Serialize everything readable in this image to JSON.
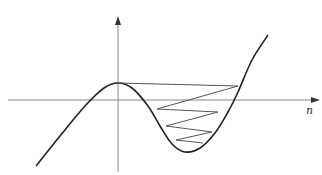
{
  "diagram": {
    "type": "cobweb-plot",
    "x_axis_label": "n",
    "colors": {
      "curve": "#222222",
      "axis": "#888888",
      "cobweb": "#555555"
    },
    "axes": {
      "origin": [
        118,
        100
      ],
      "x_axis_end": 316,
      "y_axis_top": 20,
      "y_axis_bottom": 172
    },
    "curve_points": [
      [
        36,
        166
      ],
      [
        60,
        136
      ],
      [
        85,
        106
      ],
      [
        104,
        88
      ],
      [
        118,
        83
      ],
      [
        132,
        88
      ],
      [
        148,
        106
      ],
      [
        160,
        126
      ],
      [
        172,
        144
      ],
      [
        185,
        152
      ],
      [
        200,
        148
      ],
      [
        215,
        133
      ],
      [
        228,
        112
      ],
      [
        238,
        92
      ],
      [
        252,
        60
      ],
      [
        268,
        35
      ]
    ],
    "cobweb_points": [
      [
        118,
        83
      ],
      [
        238,
        86
      ],
      [
        157,
        109
      ],
      [
        218,
        112
      ],
      [
        166,
        126
      ],
      [
        212,
        132
      ],
      [
        176,
        140
      ],
      [
        203,
        143
      ]
    ]
  }
}
